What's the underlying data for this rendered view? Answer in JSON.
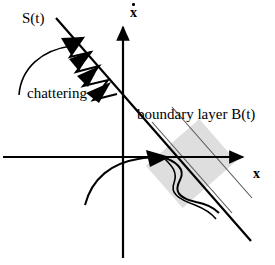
{
  "figure": {
    "background_color": "#ffffff",
    "stroke_color": "#000000",
    "band_fill_color": "#dcdcdc",
    "band_edge_color": "#4d4d4d",
    "width": 275,
    "height": 265
  },
  "axes": {
    "x_label": "x",
    "y_label_base": "x",
    "y_label_accent": "dot",
    "origin": {
      "x": 123,
      "y": 157
    },
    "x_axis": {
      "x1": 3,
      "y1": 157,
      "x2": 248,
      "y2": 157
    },
    "y_axis": {
      "x1": 123,
      "y1": 258,
      "x2": 123,
      "y2": 22
    }
  },
  "annotations": {
    "sliding_surface_label": "S(t)",
    "chattering_label": "chattering",
    "boundary_layer_label": "boundary layer B(t)"
  },
  "elements": {
    "sliding_line": {
      "x1": 56,
      "y1": 18,
      "x2": 251,
      "y2": 241
    },
    "boundary_band_label": "boundary layer B(t)",
    "chattering_zigzag_segments": 5,
    "chattering_arrowheads": 4,
    "trajectory_arrowhead_at": {
      "x": 163,
      "y": 157
    }
  }
}
